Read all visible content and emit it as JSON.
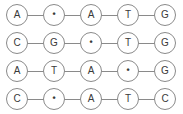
{
  "diagram": {
    "node_shape": "circle",
    "gap_symbol": "•",
    "colors": {
      "background": "#ffffff",
      "node_border": "#8a8a8a",
      "node_fill": "#ffffff",
      "text": "#3a3a3a",
      "edge": "#8a8a8a"
    },
    "rows": [
      {
        "index": 0,
        "cells": [
          {
            "label": "A",
            "type": "base"
          },
          {
            "label": "•",
            "type": "gap"
          },
          {
            "label": "A",
            "type": "base"
          },
          {
            "label": "T",
            "type": "base"
          },
          {
            "label": "G",
            "type": "base"
          }
        ]
      },
      {
        "index": 1,
        "cells": [
          {
            "label": "C",
            "type": "base"
          },
          {
            "label": "G",
            "type": "base"
          },
          {
            "label": "•",
            "type": "gap"
          },
          {
            "label": "T",
            "type": "base"
          },
          {
            "label": "G",
            "type": "base"
          }
        ]
      },
      {
        "index": 2,
        "cells": [
          {
            "label": "A",
            "type": "base"
          },
          {
            "label": "T",
            "type": "base"
          },
          {
            "label": "A",
            "type": "base"
          },
          {
            "label": "•",
            "type": "gap"
          },
          {
            "label": "G",
            "type": "base"
          }
        ]
      },
      {
        "index": 3,
        "cells": [
          {
            "label": "C",
            "type": "base"
          },
          {
            "label": "•",
            "type": "gap"
          },
          {
            "label": "A",
            "type": "base"
          },
          {
            "label": "T",
            "type": "base"
          },
          {
            "label": "C",
            "type": "base"
          }
        ]
      }
    ]
  }
}
